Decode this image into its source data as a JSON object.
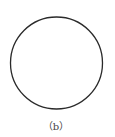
{
  "figure": {
    "caption": "（b）",
    "shape": "circle",
    "stroke_color": "#2a2a2a",
    "background": "#ffffff"
  }
}
